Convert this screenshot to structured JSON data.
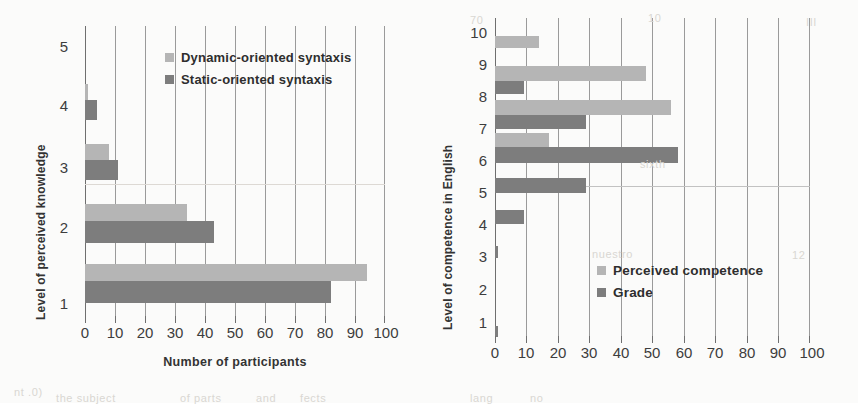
{
  "figure": {
    "background": "#fbfbfa",
    "colors": {
      "light_series": "#b5b5b5",
      "dark_series": "#7d7d7d",
      "gridline": "#9a9a9a",
      "axis": "#6f6f6f",
      "text": "#3d3d3d"
    },
    "ghost_text": [
      {
        "text": "70",
        "x": 470,
        "y": 14
      },
      {
        "text": "10",
        "x": 648,
        "y": 12
      },
      {
        "text": "III",
        "x": 806,
        "y": 16
      },
      {
        "text": "sixth",
        "x": 640,
        "y": 158
      },
      {
        "text": "nuestro",
        "x": 592,
        "y": 248
      },
      {
        "text": "12",
        "x": 792,
        "y": 249
      },
      {
        "text": "nt .0)",
        "x": 14,
        "y": 386
      },
      {
        "text": "the subject",
        "x": 56,
        "y": 392
      },
      {
        "text": "of parts",
        "x": 180,
        "y": 392
      },
      {
        "text": "and",
        "x": 256,
        "y": 392
      },
      {
        "text": "lang",
        "x": 470,
        "y": 392
      },
      {
        "text": "no",
        "x": 530,
        "y": 392
      },
      {
        "text": "fects",
        "x": 300,
        "y": 392
      }
    ]
  },
  "chart_data": [
    {
      "id": "left",
      "type": "bar",
      "orientation": "horizontal",
      "title": "",
      "xlabel": "Number of participants",
      "ylabel": "Level of perceived knowledge",
      "categories": [
        "1",
        "2",
        "3",
        "4",
        "5"
      ],
      "xticks": [
        0,
        10,
        20,
        30,
        40,
        50,
        60,
        70,
        80,
        90,
        100
      ],
      "xlim": [
        0,
        100
      ],
      "grid": true,
      "legend_position": "upper-center",
      "series": [
        {
          "name": "Dynamic-oriented syntaxis",
          "color": "#b5b5b5",
          "values": [
            94,
            34,
            8,
            1,
            0
          ]
        },
        {
          "name": "Static-oriented syntaxis",
          "color": "#7d7d7d",
          "values": [
            82,
            43,
            11,
            4,
            0
          ]
        }
      ]
    },
    {
      "id": "right",
      "type": "bar",
      "orientation": "horizontal",
      "title": "",
      "xlabel": "",
      "ylabel": "Level of competence in English",
      "categories": [
        "1",
        "2",
        "3",
        "4",
        "5",
        "6",
        "7",
        "8",
        "9",
        "10"
      ],
      "xticks": [
        0,
        10,
        20,
        30,
        40,
        50,
        60,
        70,
        80,
        90,
        100
      ],
      "xlim": [
        0,
        100
      ],
      "grid": true,
      "legend_position": "lower-center",
      "series": [
        {
          "name": "Perceived competence",
          "color": "#b5b5b5",
          "values": [
            0,
            0,
            0,
            0,
            0,
            0,
            17,
            56,
            48,
            14
          ]
        },
        {
          "name": "Grade",
          "color": "#7d7d7d",
          "values": [
            1,
            0,
            0,
            1,
            9,
            29,
            58,
            29,
            9,
            0
          ]
        }
      ]
    }
  ]
}
